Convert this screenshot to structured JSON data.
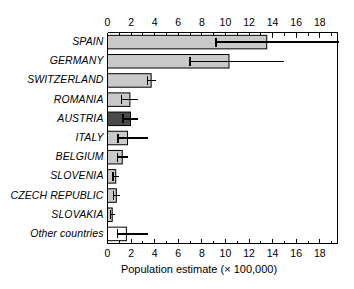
{
  "chart_data": {
    "type": "bar",
    "orientation": "horizontal",
    "title": "",
    "subtitle": "",
    "xlabel": "Population estimate (× 100,000)",
    "ylabel": "",
    "xlim": [
      0,
      19.5
    ],
    "ylim": [
      0,
      11
    ],
    "grid": false,
    "legend": null,
    "x_ticks_major": [
      0,
      2,
      4,
      6,
      8,
      10,
      12,
      14,
      16,
      18
    ],
    "x_ticks_minor": [
      1,
      3,
      5,
      7,
      9,
      11,
      13,
      15,
      17,
      19
    ],
    "x_tick_labels": [
      "0",
      "2",
      "4",
      "6",
      "8",
      "10",
      "12",
      "14",
      "16",
      "18"
    ],
    "axis_top": true,
    "axis_bottom": true,
    "categories": [
      "SPAIN",
      "GERMANY",
      "SWITZERLAND",
      "ROMANIA",
      "AUSTRIA",
      "ITALY",
      "BELGIUM",
      "SLOVENIA",
      "CZECH REPUBLIC",
      "SLOVAKIA",
      "Other countries"
    ],
    "values": [
      13.5,
      10.3,
      3.7,
      1.9,
      1.95,
      1.7,
      1.25,
      0.7,
      0.75,
      0.4,
      1.6
    ],
    "error_low": [
      9.2,
      7.0,
      3.4,
      1.2,
      1.3,
      0.9,
      0.85,
      0.45,
      0.5,
      0.25,
      0.85
    ],
    "error_high": [
      19.6,
      15.0,
      4.1,
      2.6,
      2.6,
      3.4,
      1.75,
      1.0,
      1.1,
      0.6,
      3.4
    ],
    "bar_fills": [
      "#c9c9c9",
      "#c9c9c9",
      "#c9c9c9",
      "#c9c9c9",
      "#4a4a4a",
      "#c9c9c9",
      "#c9c9c9",
      "#c9c9c9",
      "#c9c9c9",
      "#c9c9c9",
      "#ffffff"
    ],
    "bar_edge_color": "#000000",
    "error_bar_color": "#000000"
  },
  "axis": {
    "x_title": "Population estimate (× 100,000)"
  }
}
